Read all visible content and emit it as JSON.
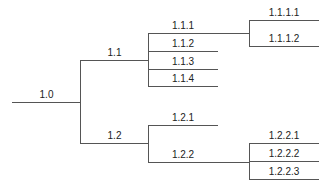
{
  "diagram": {
    "type": "tree",
    "line_color": "#555555",
    "nodes": [
      {
        "id": "1.0",
        "label": "1.0",
        "parent": null
      },
      {
        "id": "1.1",
        "label": "1.1",
        "parent": "1.0"
      },
      {
        "id": "1.2",
        "label": "1.2",
        "parent": "1.0"
      },
      {
        "id": "1.1.1",
        "label": "1.1.1",
        "parent": "1.1"
      },
      {
        "id": "1.1.2",
        "label": "1.1.2",
        "parent": "1.1"
      },
      {
        "id": "1.1.3",
        "label": "1.1.3",
        "parent": "1.1"
      },
      {
        "id": "1.1.4",
        "label": "1.1.4",
        "parent": "1.1"
      },
      {
        "id": "1.1.1.1",
        "label": "1.1.1.1",
        "parent": "1.1.1"
      },
      {
        "id": "1.1.1.2",
        "label": "1.1.1.2",
        "parent": "1.1.1"
      },
      {
        "id": "1.2.1",
        "label": "1.2.1",
        "parent": "1.2"
      },
      {
        "id": "1.2.2",
        "label": "1.2.2",
        "parent": "1.2"
      },
      {
        "id": "1.2.2.1",
        "label": "1.2.2.1",
        "parent": "1.2.2"
      },
      {
        "id": "1.2.2.2",
        "label": "1.2.2.2",
        "parent": "1.2.2"
      },
      {
        "id": "1.2.2.3",
        "label": "1.2.2.3",
        "parent": "1.2.2"
      }
    ],
    "labels": {
      "n1_0": "1.0",
      "n1_1": "1.1",
      "n1_2": "1.2",
      "n1_1_1": "1.1.1",
      "n1_1_2": "1.1.2",
      "n1_1_3": "1.1.3",
      "n1_1_4": "1.1.4",
      "n1_1_1_1": "1.1.1.1",
      "n1_1_1_2": "1.1.1.2",
      "n1_2_1": "1.2.1",
      "n1_2_2": "1.2.2",
      "n1_2_2_1": "1.2.2.1",
      "n1_2_2_2": "1.2.2.2",
      "n1_2_2_3": "1.2.2.3"
    }
  }
}
